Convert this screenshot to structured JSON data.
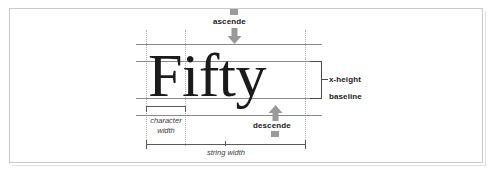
{
  "figure": {
    "sample_word": "Fifty",
    "background_color": "#ffffff",
    "frame_color": "#c9c9c9",
    "rule_color": "#8a8a8a",
    "guide_color": "#b0b0b0",
    "arrow_color": "#9a9a9a",
    "text_color": "#1b1b1b"
  },
  "labels": {
    "ascender": "ascende",
    "descender": "descende",
    "x_height": "x-height",
    "baseline": "baseline",
    "character_width_line1": "character",
    "character_width_line2": "width",
    "string_width": "string width"
  },
  "icons": {
    "ascender_arrow": "arrow-down-block-icon",
    "descender_arrow": "arrow-up-block-icon",
    "ascender_marker": "gray-square-marker",
    "descender_marker": "gray-square-marker"
  },
  "guides": {
    "horizontal_rules": [
      {
        "name": "ascender-line",
        "y": 44
      },
      {
        "name": "x-height-line",
        "y": 61
      },
      {
        "name": "baseline",
        "y": 98
      },
      {
        "name": "descender-line",
        "y": 115
      }
    ],
    "vertical_guides": [
      {
        "name": "string-start-guide",
        "x": 146
      },
      {
        "name": "character-end-guide",
        "x": 185
      },
      {
        "name": "string-end-guide",
        "x": 305
      }
    ]
  },
  "measures": {
    "character_width": {
      "from_x": 146,
      "to_x": 185
    },
    "string_width": {
      "from_x": 146,
      "to_x": 305
    },
    "x_height_bracket": {
      "from_y": 61,
      "to_y": 98
    }
  }
}
